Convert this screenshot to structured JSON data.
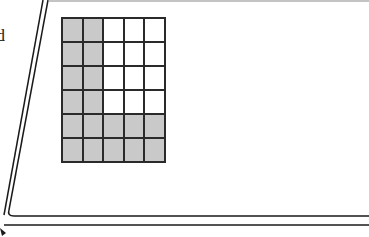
{
  "figure": {
    "label": "grid",
    "label_visible": "rid",
    "colors": {
      "shaded": "#c9c9c9",
      "unshaded": "#ffffff",
      "lines": "#2a2a2a"
    },
    "grid": {
      "columns": 5,
      "rows": 6,
      "cells": [
        [
          1,
          1,
          0,
          0,
          0
        ],
        [
          1,
          1,
          0,
          0,
          0
        ],
        [
          1,
          1,
          0,
          0,
          0
        ],
        [
          1,
          1,
          0,
          0,
          0
        ],
        [
          1,
          1,
          1,
          1,
          1
        ],
        [
          1,
          1,
          1,
          1,
          1
        ]
      ],
      "shaded_count": 18,
      "total_count": 30
    }
  }
}
